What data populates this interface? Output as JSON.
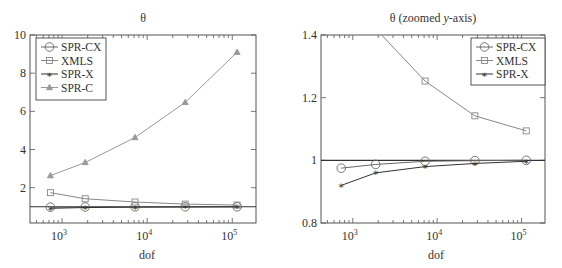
{
  "figure": {
    "width": 562,
    "height": 268,
    "axis_color": "#555555"
  },
  "chart_data": [
    {
      "type": "line",
      "title": "θ",
      "xlabel": "dof",
      "ylabel": "",
      "xscale": "log",
      "xlim": [
        420,
        190000
      ],
      "ylim": [
        0.15,
        10
      ],
      "xticks": [
        {
          "value": 1000,
          "label": "10",
          "exp": "3"
        },
        {
          "value": 10000,
          "label": "10",
          "exp": "4"
        },
        {
          "value": 100000,
          "label": "10",
          "exp": "5"
        }
      ],
      "yticks": [
        {
          "value": 2,
          "label": "2"
        },
        {
          "value": 4,
          "label": "4"
        },
        {
          "value": 6,
          "label": "6"
        },
        {
          "value": 8,
          "label": "8"
        },
        {
          "value": 10,
          "label": "10"
        }
      ],
      "reference_line": 1,
      "grid": false,
      "legend_position": "upper left",
      "frame": {
        "x": 30,
        "y": 35,
        "w": 226,
        "h": 188
      },
      "legend_box": {
        "x": 36,
        "y": 38,
        "w": 70,
        "h": 62
      },
      "x": [
        730,
        1870,
        7200,
        28000,
        114000
      ],
      "series": [
        {
          "name": "SPR-CX",
          "marker": "circle",
          "color": "#666666",
          "values": [
            0.98,
            0.99,
            1.0,
            1.0,
            1.0
          ]
        },
        {
          "name": "XMLS",
          "marker": "square",
          "color": "#888888",
          "values": [
            1.74,
            1.42,
            1.25,
            1.14,
            1.09
          ]
        },
        {
          "name": "SPR-X",
          "marker": "star",
          "color": "#333333",
          "values": [
            0.92,
            0.96,
            0.98,
            0.99,
            1.0
          ]
        },
        {
          "name": "SPR-C",
          "marker": "triangle",
          "color": "#999999",
          "values": [
            2.63,
            3.32,
            4.63,
            6.47,
            9.1
          ]
        }
      ]
    },
    {
      "type": "line",
      "title": "θ (zoomed y-axis)",
      "title_parts": {
        "pre": "θ (zoomed ",
        "italic": "y",
        "post": "-axis)"
      },
      "xlabel": "dof",
      "ylabel": "",
      "xscale": "log",
      "xlim": [
        420,
        190000
      ],
      "ylim": [
        0.8,
        1.4
      ],
      "xticks": [
        {
          "value": 1000,
          "label": "10",
          "exp": "3"
        },
        {
          "value": 10000,
          "label": "10",
          "exp": "4"
        },
        {
          "value": 100000,
          "label": "10",
          "exp": "5"
        }
      ],
      "yticks": [
        {
          "value": 0.8,
          "label": "0.8"
        },
        {
          "value": 1.0,
          "label": "1"
        },
        {
          "value": 1.2,
          "label": "1.2"
        },
        {
          "value": 1.4,
          "label": "1.4"
        }
      ],
      "reference_line": 1,
      "grid": false,
      "legend_position": "upper right",
      "frame": {
        "x": 321,
        "y": 35,
        "w": 224,
        "h": 188
      },
      "legend_box": {
        "x": 471,
        "y": 38,
        "w": 74,
        "h": 47
      },
      "x": [
        730,
        1870,
        7200,
        28000,
        114000
      ],
      "series": [
        {
          "name": "SPR-CX",
          "marker": "circle",
          "color": "#666666",
          "values": [
            0.975,
            0.987,
            0.997,
            0.999,
            1.0
          ]
        },
        {
          "name": "XMLS",
          "marker": "square",
          "color": "#888888",
          "values": [
            1.74,
            1.42,
            1.253,
            1.142,
            1.094
          ]
        },
        {
          "name": "SPR-X",
          "marker": "star",
          "color": "#333333",
          "values": [
            0.92,
            0.96,
            0.98,
            0.99,
            0.997
          ]
        }
      ]
    }
  ]
}
